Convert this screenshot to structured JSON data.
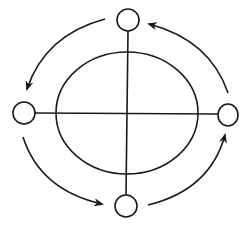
{
  "diagram": {
    "type": "cyclic-flow",
    "direction": "counter-clockwise",
    "stroke_color": "#1a1a1a",
    "background": "#ffffff",
    "center_ellipse": {
      "cx": 127,
      "cy": 113,
      "rx": 71,
      "ry": 61
    },
    "crosshair": {
      "horizontal": {
        "x1": 35,
        "y1": 113,
        "x2": 218,
        "y2": 114
      },
      "vertical": {
        "x1": 128,
        "y1": 31,
        "x2": 126,
        "y2": 195
      }
    },
    "nodes": [
      {
        "id": "top",
        "cx": 128,
        "cy": 20,
        "rx": 11,
        "ry": 11
      },
      {
        "id": "left",
        "cx": 24,
        "cy": 113,
        "rx": 11,
        "ry": 11
      },
      {
        "id": "bottom",
        "cx": 126,
        "cy": 206,
        "rx": 11,
        "ry": 11
      },
      {
        "id": "right",
        "cx": 228,
        "cy": 115,
        "rx": 10,
        "ry": 11
      }
    ],
    "arrows": [
      {
        "id": "top-to-left",
        "from": "top",
        "to": "left"
      },
      {
        "id": "left-to-bottom",
        "from": "left",
        "to": "bottom"
      },
      {
        "id": "bottom-to-right",
        "from": "bottom",
        "to": "right"
      },
      {
        "id": "right-to-top",
        "from": "right",
        "to": "top"
      }
    ]
  }
}
